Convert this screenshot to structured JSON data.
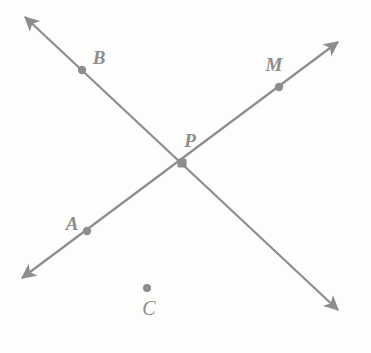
{
  "figure": {
    "width": 371,
    "height": 353,
    "background_color": "#fdfdfc",
    "stroke_color": "#8d8d8d",
    "label_color": "#8d8d8d",
    "stroke_width": 2.2,
    "dot_radius": 4.2
  },
  "labels": {
    "a": "A",
    "b": "B",
    "c": "C",
    "m": "M",
    "p": "P"
  },
  "points": [
    {
      "id": "b",
      "label": "B",
      "x": 82,
      "y": 70,
      "label_x": 99,
      "label_y": 57,
      "on_line": "line-bp"
    },
    {
      "id": "m",
      "label": "M",
      "x": 279,
      "y": 87,
      "label_x": 274,
      "label_y": 64,
      "on_line": "line-apm"
    },
    {
      "id": "p",
      "label": "P",
      "x": 182,
      "y": 163,
      "label_x": 190,
      "label_y": 140,
      "on_line": "intersection"
    },
    {
      "id": "a",
      "label": "A",
      "x": 87,
      "y": 231,
      "label_x": 72,
      "label_y": 223,
      "on_line": "line-apm"
    },
    {
      "id": "c",
      "label": "C",
      "x": 147,
      "y": 288,
      "label_x": 149,
      "label_y": 308,
      "on_line": "none"
    }
  ],
  "lines": [
    {
      "id": "line-apm",
      "description": "line through A, P and M, arrowheads at both ends",
      "from_x": 22,
      "from_y": 278,
      "to_x": 338,
      "to_y": 42,
      "arrow_start": true,
      "arrow_end": true,
      "contains": [
        "A",
        "P",
        "M"
      ]
    },
    {
      "id": "line-bp",
      "description": "line through B and P, arrowheads at both ends",
      "from_x": 25,
      "from_y": 17,
      "to_x": 338,
      "to_y": 310,
      "arrow_start": true,
      "arrow_end": true,
      "contains": [
        "B",
        "P"
      ]
    }
  ]
}
